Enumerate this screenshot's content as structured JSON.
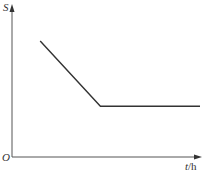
{
  "chart_data": {
    "type": "line",
    "title": "",
    "xlabel": "t/h",
    "ylabel": "S",
    "origin_label": "O",
    "grid": false,
    "legend": null,
    "x_ticks": [],
    "y_ticks": [],
    "series": [
      {
        "name": "S vs t",
        "points": [
          {
            "x": 0.15,
            "y": 0.8
          },
          {
            "x": 0.47,
            "y": 0.35
          },
          {
            "x": 1.0,
            "y": 0.35
          }
        ]
      }
    ]
  },
  "axes": {
    "x_label_var": "t",
    "x_label_unit": "/h",
    "y_label": "S",
    "origin": "O"
  }
}
